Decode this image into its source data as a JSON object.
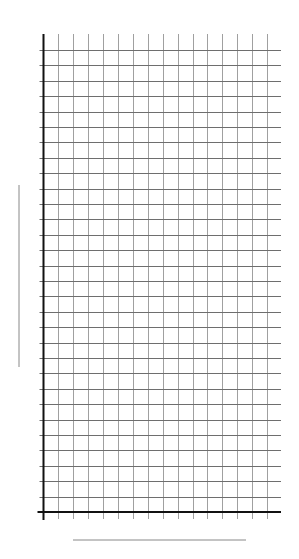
{
  "chart_data": {
    "type": "line",
    "title": "",
    "xlabel": "",
    "ylabel": "",
    "categories": [],
    "series": [],
    "x_ticks": 16,
    "y_ticks": 31,
    "grid": true,
    "legend": null
  },
  "layout": {
    "origin": {
      "x": 43.5,
      "y": 512
    },
    "x_spacing": 14.9,
    "y_spacing": 15.4,
    "columns": 16,
    "rows": 30,
    "grid_right": 281,
    "grid_top": 34,
    "xlabel_line": {
      "x1": 73,
      "x2": 246,
      "y": 540
    },
    "ylabel_line": {
      "x": 19,
      "y1": 185,
      "y2": 367
    }
  },
  "colors": {
    "axis": "#111111",
    "grid_vertical": "#a0a0a0",
    "grid_horizontal": "#6e6e6e",
    "label_line": "#888888",
    "background": "#ffffff"
  }
}
